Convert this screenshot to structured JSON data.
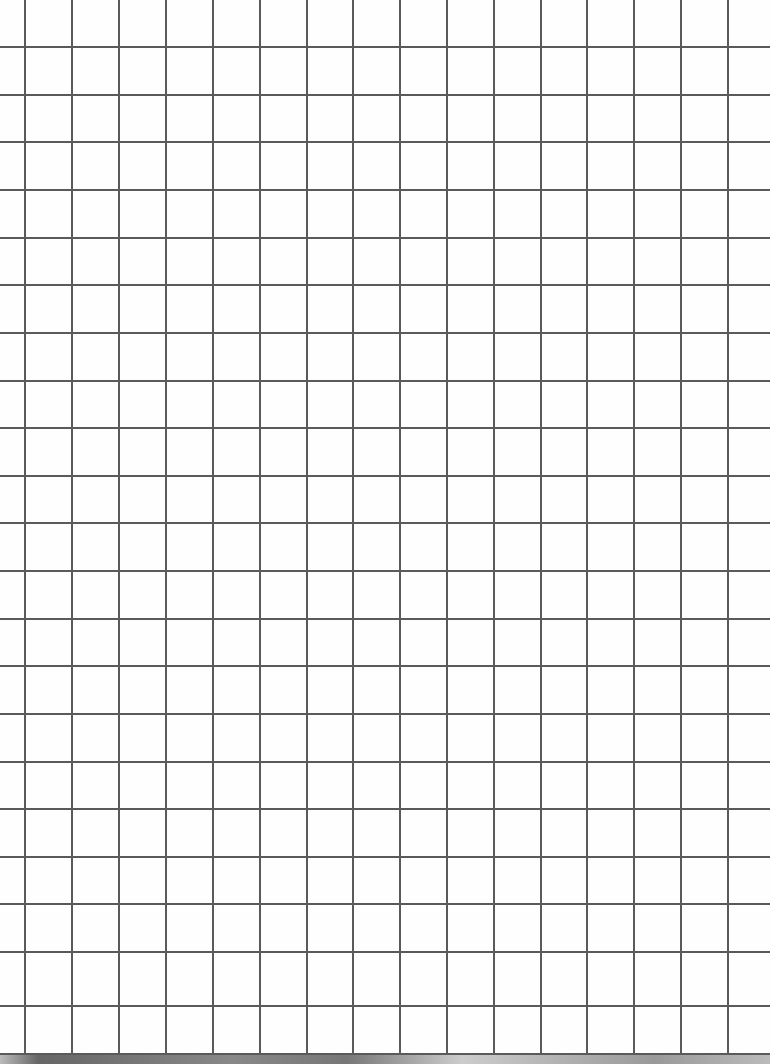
{
  "sheet": {
    "type": "graph-paper",
    "line_color": "#5a5a5a",
    "background": "#fefefe",
    "vertical_lines_x": [
      25,
      72,
      119,
      166,
      213,
      260,
      307,
      353,
      400,
      447,
      494,
      541,
      587,
      634,
      681,
      728
    ],
    "horizontal_lines_y": [
      47,
      95,
      142,
      190,
      238,
      285,
      333,
      381,
      428,
      476,
      523,
      571,
      619,
      666,
      714,
      762,
      809,
      857,
      904,
      952,
      1006,
      1054
    ]
  }
}
